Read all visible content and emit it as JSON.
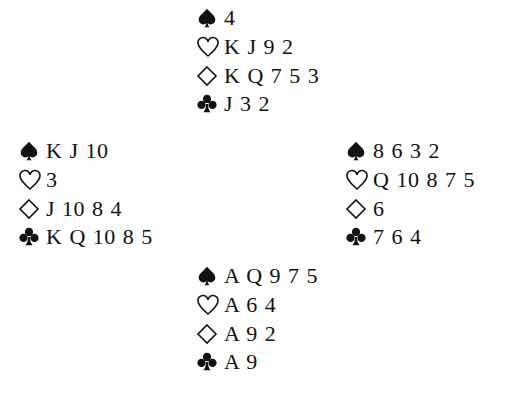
{
  "deal": {
    "north": {
      "spades": "4",
      "hearts": "K J 9 2",
      "diamonds": "K Q 7 5 3",
      "clubs": "J 3 2"
    },
    "west": {
      "spades": "K J 10",
      "hearts": "3",
      "diamonds": "J 10 8 4",
      "clubs": "K Q 10 8 5"
    },
    "east": {
      "spades": "8 6 3 2",
      "hearts": "Q 10 8 7 5",
      "diamonds": "6",
      "clubs": "7 6 4"
    },
    "south": {
      "spades": "A Q 9 7 5",
      "hearts": "A 6 4",
      "diamonds": "A 9 2",
      "clubs": "A 9"
    }
  },
  "icons": {
    "spades": "spade-icon (filled)",
    "hearts": "heart-icon (outline)",
    "diamonds": "diamond-icon (outline)",
    "clubs": "club-icon (filled)"
  },
  "colors": {
    "text": "#111111",
    "background": "#ffffff"
  }
}
